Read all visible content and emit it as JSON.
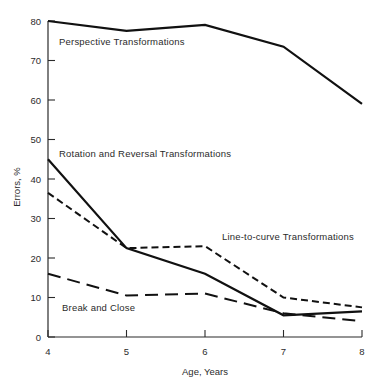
{
  "chart_data": {
    "type": "line",
    "title": "",
    "subtitle": "",
    "xlabel": "Age, Years",
    "ylabel": "Errors, %",
    "x": [
      4,
      5,
      6,
      7,
      8
    ],
    "xticklabels": [
      "4",
      "5",
      "6",
      "7",
      "8"
    ],
    "yticklabels": [
      "0",
      "10",
      "20",
      "30",
      "40",
      "50",
      "60",
      "70",
      "80"
    ],
    "yticks": [
      0,
      10,
      20,
      30,
      40,
      50,
      60,
      70,
      80
    ],
    "xlim": [
      4,
      8
    ],
    "ylim": [
      0,
      80
    ],
    "grid": false,
    "legend_position": "inline-annotations",
    "series": [
      {
        "name": "Perspective Transformations",
        "label": "Perspective Transformations",
        "style": "solid",
        "color": "#111111",
        "width": 2.2,
        "values": [
          80,
          77.5,
          79,
          73.5,
          59
        ]
      },
      {
        "name": "Rotation and Reversal Transformations",
        "label": "Rotation and Reversal Transformations",
        "style": "solid",
        "color": "#111111",
        "width": 2.2,
        "values": [
          45,
          22.5,
          16,
          5.5,
          6.5
        ]
      },
      {
        "name": "Line-to-curve Transformations",
        "label": "Line-to-curve Transformations",
        "style": "short-dash",
        "color": "#111111",
        "width": 2.0,
        "values": [
          36.5,
          22.5,
          23,
          10,
          7.5
        ]
      },
      {
        "name": "Break and Close",
        "label": "Break and Close",
        "style": "long-dash",
        "color": "#111111",
        "width": 2.0,
        "values": [
          16,
          10.5,
          11,
          6,
          4
        ]
      }
    ],
    "annotations": [
      {
        "text": "Perspective Transformations",
        "x_px": 59,
        "y_px": 45
      },
      {
        "text": "Rotation and Reversal Transformations",
        "x_px": 59,
        "y_px": 157
      },
      {
        "text": "Line-to-curve Transformations",
        "x_px": 222,
        "y_px": 240
      },
      {
        "text": "Break and Close",
        "x_px": 62,
        "y_px": 311
      }
    ]
  }
}
